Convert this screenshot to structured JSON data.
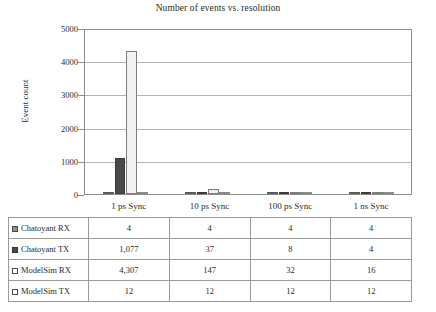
{
  "chart_data": {
    "type": "bar",
    "title": "Number of events vs. resolution",
    "xlabel": "",
    "ylabel": "Event count",
    "ylim": [
      0,
      5000
    ],
    "yticks": [
      0,
      1000,
      2000,
      3000,
      4000,
      5000
    ],
    "ytick_labels": [
      "0",
      "1000",
      "2000",
      "3000",
      "4000",
      "5000"
    ],
    "grid": true,
    "legend_position": "table-row-labels",
    "categories": [
      "1 ps Sync",
      "10 ps Sync",
      "100 ps Sync",
      "1 ns Sync"
    ],
    "series": [
      {
        "name": "Chatoyant RX",
        "swatch": "sw-chatoyant-rx",
        "color": "#8f8f8f",
        "values": [
          4,
          4,
          4,
          4
        ],
        "labels": [
          "4",
          "4",
          "4",
          "4"
        ]
      },
      {
        "name": "Chatoyant TX",
        "swatch": "sw-chatoyant-tx",
        "color": "#4a4a4a",
        "values": [
          1077,
          37,
          8,
          4
        ],
        "labels": [
          "1,077",
          "37",
          "8",
          "4"
        ]
      },
      {
        "name": "ModelSim RX",
        "swatch": "sw-modelsim-rx",
        "color": "#f2f2f2",
        "values": [
          4307,
          147,
          32,
          16
        ],
        "labels": [
          "4,307",
          "147",
          "32",
          "16"
        ]
      },
      {
        "name": "ModelSim TX",
        "swatch": "sw-modelsim-tx",
        "color": "#fbfbfb",
        "values": [
          12,
          12,
          12,
          12
        ],
        "labels": [
          "12",
          "12",
          "12",
          "12"
        ]
      }
    ]
  }
}
